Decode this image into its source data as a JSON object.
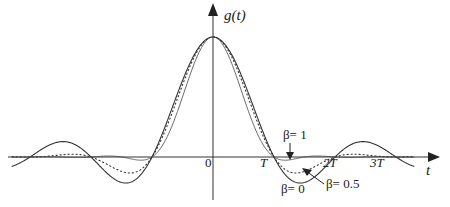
{
  "chart_data": {
    "type": "line",
    "title": "",
    "xlabel": "t",
    "ylabel": "g(t)",
    "xlim": [
      -3.3,
      3.5
    ],
    "ylim": [
      -0.3,
      1.15
    ],
    "x_unit": "T",
    "grid": false,
    "x_ticks": [
      {
        "value": 0,
        "label": "0"
      },
      {
        "value": 1,
        "label": "T"
      },
      {
        "value": 2,
        "label": "2T"
      },
      {
        "value": 3,
        "label": "3T"
      }
    ],
    "series": [
      {
        "name": "β= 0",
        "style": "solid",
        "formula": "sinc(t/T)"
      },
      {
        "name": "β= 0.5",
        "style": "dashed",
        "formula": "raised-cosine, rolloff 0.5"
      },
      {
        "name": "β= 1",
        "style": "solid-thin",
        "formula": "raised-cosine, rolloff 1"
      }
    ],
    "annotations": [
      {
        "text": "β= 1",
        "points_to": "β= 1 curve just after T"
      },
      {
        "text": "β= 0",
        "points_to": "β= 0 curve minimum between T and 2T"
      },
      {
        "text": "β= 0.5",
        "points_to": "β= 0.5 curve between T and 2T"
      }
    ]
  }
}
